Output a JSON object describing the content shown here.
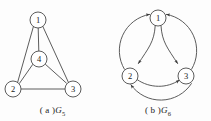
{
  "figure": {
    "background_color": "#fdfdfd",
    "stroke_color": "#4a4a4a",
    "node_fill": "#ffffff",
    "label_color": "#1b1b1b"
  },
  "panels": [
    {
      "id": "a",
      "caption_prefix": "( a )",
      "caption_symbol": "G",
      "caption_subscript": "5",
      "graph_type": "undirected",
      "nodes": [
        {
          "label": "1",
          "cx": 38,
          "cy": 20,
          "r": 8
        },
        {
          "label": "4",
          "cx": 39,
          "cy": 59,
          "r": 8
        },
        {
          "label": "2",
          "cx": 13,
          "cy": 89,
          "r": 8
        },
        {
          "label": "3",
          "cx": 73,
          "cy": 89,
          "r": 8
        }
      ],
      "edges": [
        {
          "from": "1",
          "to": "2"
        },
        {
          "from": "1",
          "to": "3"
        },
        {
          "from": "1",
          "to": "4"
        },
        {
          "from": "4",
          "to": "2"
        },
        {
          "from": "4",
          "to": "3"
        },
        {
          "from": "2",
          "to": "3"
        }
      ]
    },
    {
      "id": "b",
      "caption_prefix": "( b )",
      "caption_symbol": "G",
      "caption_subscript": "6",
      "graph_type": "directed",
      "nodes": [
        {
          "label": "1",
          "cx": 53,
          "cy": 18,
          "r": 8
        },
        {
          "label": "2",
          "cx": 25,
          "cy": 76,
          "r": 8
        },
        {
          "label": "3",
          "cx": 81,
          "cy": 76,
          "r": 8
        }
      ],
      "arcs": [
        {
          "from": "2",
          "to": "1",
          "side": "outer-left"
        },
        {
          "from": "3",
          "to": "1",
          "side": "outer-right"
        },
        {
          "from": "3",
          "to": "2",
          "side": "outer-bottom"
        },
        {
          "from": "1",
          "to": "2",
          "side": "inner-left"
        },
        {
          "from": "1",
          "to": "3",
          "side": "inner-right"
        },
        {
          "from": "2",
          "to": "3",
          "side": "inner-bottom"
        }
      ]
    }
  ]
}
